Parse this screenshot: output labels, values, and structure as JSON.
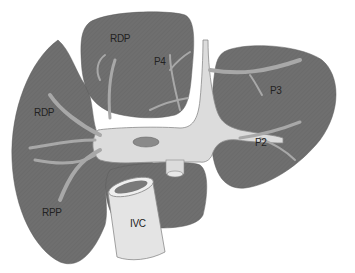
{
  "diagram": {
    "type": "anatomical-illustration",
    "colors": {
      "lobe": "#6f6f6f",
      "lobe_edge": "#5a5a5a",
      "vessel": "#d9d9d9",
      "vessel_branch": "#a9a9a9",
      "vessel_edge": "#8a8a8a",
      "ivc_body": "#e6e6e6",
      "ivc_lumen": "#7a7a7a",
      "background": "#ffffff",
      "label_text": "#222222"
    },
    "labels": {
      "top_lobe_rdp": "RDP",
      "top_lobe_p4": "P4",
      "left_lobe_rdp": "RDP",
      "right_lobe_p3": "P3",
      "right_lobe_p2": "P2",
      "left_lobe_rpp": "RPP",
      "ivc": "IVC"
    }
  }
}
